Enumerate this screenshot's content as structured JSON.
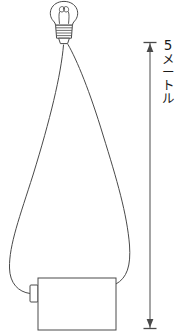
{
  "figure": {
    "background_color": "#ffffff",
    "stroke_color": "#4a4a4a",
    "text_color": "#1a1a1a",
    "width": 180,
    "height": 334
  },
  "dimension": {
    "value": "5",
    "unit_chars": [
      "メ",
      "ー",
      "ト",
      "ル"
    ],
    "unit_text": "メートル",
    "full_text": "5メートル",
    "orientation": "vertical",
    "arrow": {
      "style": "double-headed",
      "x": 150,
      "y_top": 42,
      "y_bottom": 328,
      "cap_width": 13
    }
  },
  "components": {
    "bulb": {
      "label": "light-bulb",
      "glass_center_x": 64,
      "glass_center_y": 15,
      "glass_radius": 12,
      "filament": "double-loop",
      "base": {
        "label": "screw-base",
        "thread_lines": 5
      }
    },
    "battery": {
      "label": "battery-cell",
      "x": 38,
      "y": 278,
      "width": 78,
      "height": 52,
      "terminal": {
        "label": "battery-terminal-nub",
        "side": "left",
        "width": 8,
        "height": 16
      }
    },
    "wires": {
      "label": "connecting-wires",
      "count": 2,
      "shape": "teardrop-loop",
      "left_wire": "from-bulb-base-down-left-curve-to-battery-terminal",
      "right_wire": "from-bulb-base-down-right-curve-to-battery-right-edge"
    }
  }
}
